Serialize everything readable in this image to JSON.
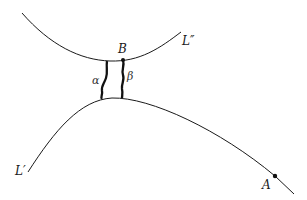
{
  "diagram": {
    "curves": [
      {
        "id": "L_double_prime",
        "label": "L″",
        "kind": "upper curve, concave up"
      },
      {
        "id": "L_prime",
        "label": "L′",
        "kind": "lower curve, concave down"
      }
    ],
    "points": [
      {
        "id": "B",
        "label": "B",
        "on": "L″"
      },
      {
        "id": "A",
        "label": "A",
        "on": "L′"
      }
    ],
    "paths": [
      {
        "id": "alpha",
        "label": "α",
        "from": "L″",
        "to": "L′"
      },
      {
        "id": "beta",
        "label": "β",
        "from": "B",
        "to": "L′"
      }
    ],
    "colors": {
      "stroke": "#1a1a1a",
      "background": "#ffffff"
    }
  },
  "labels": {
    "L_double_prime": "L″",
    "L_prime": "L′",
    "B": "B",
    "A": "A",
    "alpha": "α",
    "beta": "β"
  }
}
